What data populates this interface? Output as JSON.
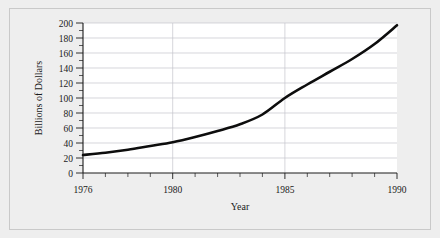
{
  "figure": {
    "background_color": "#eeeeee",
    "plot_background_color": "#ffffff",
    "border_color": "#c9c9c9",
    "curve_color": "#0d0d0d",
    "gridline_color": "#c4c4cc"
  },
  "chart_data": {
    "type": "line",
    "title": "",
    "subtitle": "",
    "xlabel": "Year",
    "ylabel": "Billions of Dollars",
    "xlim": [
      1976,
      1990
    ],
    "ylim": [
      0,
      200
    ],
    "grid": "horizontal-and-major-vertical",
    "legend": "none",
    "x_tick_labels": [
      "1976",
      "1980",
      "1985",
      "1990"
    ],
    "x_tick_values": [
      1976,
      1980,
      1985,
      1990
    ],
    "x_minor_ticks": [
      1977,
      1978,
      1979,
      1981,
      1982,
      1983,
      1984,
      1986,
      1987,
      1988,
      1989
    ],
    "y_tick_labels": [
      "0",
      "20",
      "40",
      "60",
      "80",
      "100",
      "120",
      "140",
      "160",
      "180",
      "200"
    ],
    "y_tick_values": [
      0,
      20,
      40,
      60,
      80,
      100,
      120,
      140,
      160,
      180,
      200
    ],
    "y_gridline_values": [
      20,
      40,
      60,
      80,
      100,
      120,
      140,
      160,
      180,
      200
    ],
    "series": [
      {
        "name": "Billions of Dollars",
        "x": [
          1976,
          1977,
          1978,
          1979,
          1980,
          1981,
          1982,
          1983,
          1984,
          1985,
          1986,
          1987,
          1988,
          1989,
          1990
        ],
        "values": [
          24,
          27,
          31,
          36,
          41,
          48,
          56,
          65,
          78,
          100,
          118,
          135,
          152,
          172,
          197
        ]
      }
    ]
  },
  "labels": {
    "y_axis_title": "Billions of Dollars",
    "x_axis_title": "Year"
  }
}
